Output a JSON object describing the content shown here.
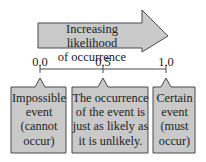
{
  "arrow": {
    "label_line1": "Increasing likelihood",
    "label_line2": "of occurrence"
  },
  "scale": {
    "ticks": [
      {
        "label": "0.0",
        "value": 0.0
      },
      {
        "label": "0.5",
        "value": 0.5
      },
      {
        "label": "1.0",
        "value": 1.0
      }
    ]
  },
  "boxes": [
    {
      "lines": [
        "Impossible",
        "event",
        "(cannot",
        "occur)"
      ],
      "points_to": "0.0"
    },
    {
      "lines": [
        "The occurrence",
        "of the event is",
        "just as likely as",
        "it is unlikely."
      ],
      "points_to": "0.5"
    },
    {
      "lines": [
        "Certain",
        "event",
        "(must",
        "occur)"
      ],
      "points_to": "1.0"
    }
  ],
  "colors": {
    "fill": "#c9c9c9",
    "stroke": "#4a4a4a",
    "text": "#222222"
  }
}
